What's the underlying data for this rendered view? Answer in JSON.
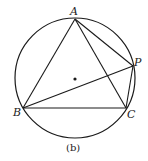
{
  "figure": {
    "caption": "(b)",
    "circle": {
      "cx": 75,
      "cy": 78,
      "r": 60
    },
    "center_dot": {
      "x": 75,
      "y": 78
    },
    "points": {
      "A": {
        "label": "A",
        "x": 75,
        "y": 19
      },
      "B": {
        "label": "B",
        "x": 23,
        "y": 108
      },
      "C": {
        "label": "C",
        "x": 126,
        "y": 108
      },
      "P": {
        "label": "P",
        "x": 133,
        "y": 66
      }
    },
    "segments": [
      "AB",
      "BC",
      "CA",
      "AP",
      "PC",
      "BP"
    ],
    "stroke_color": "#1a1a1a"
  }
}
